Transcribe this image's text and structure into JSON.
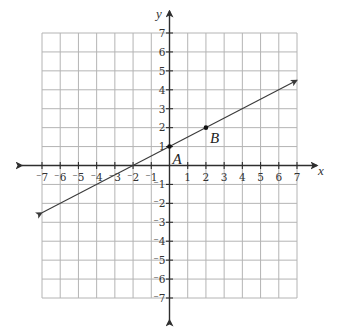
{
  "chart_data": {
    "type": "line",
    "title": "",
    "xlabel": "x",
    "ylabel": "y",
    "xlim": [
      -7,
      7
    ],
    "ylim": [
      -7,
      7
    ],
    "grid": true,
    "x_ticks": [
      -7,
      -6,
      -5,
      -4,
      -3,
      -2,
      -1,
      1,
      2,
      3,
      4,
      5,
      6,
      7
    ],
    "y_ticks": [
      -7,
      -6,
      -5,
      -4,
      -3,
      -2,
      -1,
      1,
      2,
      3,
      4,
      5,
      6,
      7
    ],
    "x_tick_labels": [
      "⁻7",
      "⁻6",
      "⁻5",
      "⁻4",
      "⁻3",
      "⁻2",
      "⁻1",
      "1",
      "2",
      "3",
      "4",
      "5",
      "6",
      "7"
    ],
    "y_tick_labels": [
      "⁻7",
      "⁻6",
      "⁻5",
      "⁻4",
      "⁻3",
      "⁻2",
      "⁻1",
      "1",
      "2",
      "3",
      "4",
      "5",
      "6",
      "7"
    ],
    "series": [
      {
        "name": "line AB",
        "equation": "y = 0.5x + 1",
        "x": [
          -7,
          7
        ],
        "y": [
          -2.5,
          4.5
        ],
        "arrows_both_ends": true
      }
    ],
    "points": [
      {
        "label": "A",
        "x": 0,
        "y": 1
      },
      {
        "label": "B",
        "x": 2,
        "y": 2
      }
    ],
    "legend": null
  },
  "colors": {
    "grid": "#b4b4b4",
    "axis": "#2e2e2e",
    "line": "#3a3a3a",
    "point": "#111111"
  },
  "labels": {
    "x_axis": "x",
    "y_axis": "y",
    "point_a": "A",
    "point_b": "B"
  }
}
